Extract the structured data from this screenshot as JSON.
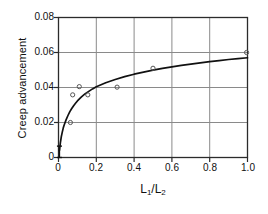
{
  "figure": {
    "background_color": "#ffffff",
    "frame_color": "#2b2b2b",
    "grid_color": "#8a8a8a",
    "curve_color": "#111111",
    "marker_color": "#555555"
  },
  "chart_data": {
    "type": "line",
    "title": "",
    "subtitle": "",
    "xlabel": "L1/L2",
    "xlabel_parts": {
      "num_base": "L",
      "num_sub": "1",
      "slash": "/",
      "den_base": "L",
      "den_sub": "2"
    },
    "ylabel": "Creep advancement",
    "xlim": [
      0,
      1.0
    ],
    "ylim": [
      0,
      0.08
    ],
    "xticks": [
      0,
      0.2,
      0.4,
      0.6,
      0.8,
      1.0
    ],
    "xtick_labels": [
      "0",
      "0.2",
      "0.4",
      "0.6",
      "0.8",
      "1.0"
    ],
    "yticks": [
      0,
      0.02,
      0.04,
      0.06,
      0.08
    ],
    "ytick_labels": [
      "0",
      "0.02",
      "0.04",
      "0.06",
      "0.08"
    ],
    "grid": true,
    "grid_axis": "both",
    "legend": null,
    "series": [
      {
        "name": "fitted curve",
        "kind": "line",
        "style": "solid",
        "x": [
          0.005,
          0.01,
          0.015,
          0.02,
          0.025,
          0.03,
          0.04,
          0.05,
          0.06,
          0.07,
          0.08,
          0.09,
          0.1,
          0.12,
          0.14,
          0.16,
          0.18,
          0.2,
          0.25,
          0.3,
          0.35,
          0.4,
          0.45,
          0.5,
          0.55,
          0.6,
          0.65,
          0.7,
          0.75,
          0.8,
          0.85,
          0.9,
          0.95,
          1.0
        ],
        "y": [
          0.004,
          0.0085,
          0.012,
          0.0145,
          0.0168,
          0.0186,
          0.0215,
          0.024,
          0.0262,
          0.028,
          0.0296,
          0.031,
          0.0323,
          0.0345,
          0.0363,
          0.0378,
          0.0392,
          0.0404,
          0.0427,
          0.0446,
          0.0462,
          0.0476,
          0.0488,
          0.0499,
          0.0509,
          0.0518,
          0.0526,
          0.0534,
          0.0541,
          0.0548,
          0.0554,
          0.056,
          0.0565,
          0.057
        ]
      },
      {
        "name": "measurements",
        "kind": "scatter",
        "marker": "open-circle",
        "points": [
          {
            "x": 0.063,
            "y": 0.02
          },
          {
            "x": 0.11,
            "y": 0.0405
          },
          {
            "x": 0.075,
            "y": 0.0358
          },
          {
            "x": 0.155,
            "y": 0.0358
          },
          {
            "x": 0.31,
            "y": 0.0402
          },
          {
            "x": 0.5,
            "y": 0.051
          },
          {
            "x": 0.995,
            "y": 0.06
          }
        ]
      },
      {
        "name": "origin error bar",
        "kind": "errorbar",
        "x": 0.005,
        "y_low": 0.0,
        "y_high": 0.0065
      }
    ]
  }
}
